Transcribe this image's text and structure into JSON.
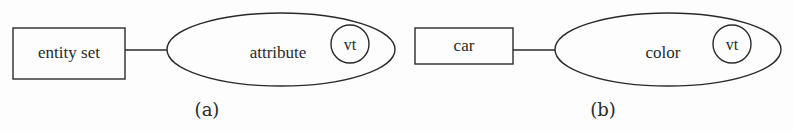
{
  "diagram": {
    "type": "er-diagram",
    "panels": [
      {
        "caption": "(a)",
        "entity": {
          "label": "entity set",
          "shape": "rectangle"
        },
        "attribute": {
          "label": "attribute",
          "shape": "ellipse"
        },
        "marker": {
          "label": "vt",
          "shape": "circle"
        }
      },
      {
        "caption": "(b)",
        "entity": {
          "label": "car",
          "shape": "rectangle"
        },
        "attribute": {
          "label": "color",
          "shape": "ellipse"
        },
        "marker": {
          "label": "vt",
          "shape": "circle"
        }
      }
    ],
    "colors": {
      "stroke": "#2a2a2a",
      "background": "#fdfdfd"
    }
  }
}
